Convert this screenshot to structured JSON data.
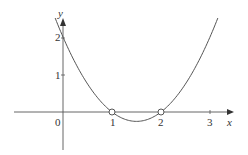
{
  "chart_data": {
    "type": "line",
    "title": "",
    "xlabel": "x",
    "ylabel": "y",
    "function": "y = x^2 - 3x + 2",
    "x_ticks": [
      "1",
      "2",
      "3"
    ],
    "y_ticks": [
      "1",
      "2"
    ],
    "origin_label": "0",
    "xlim": [
      -1,
      3.5
    ],
    "ylim": [
      -1,
      2.6
    ],
    "open_circles": [
      {
        "x": 1,
        "y": 0
      },
      {
        "x": 2,
        "y": 0
      }
    ],
    "series": [
      {
        "name": "curve",
        "x": [
          -0.16,
          0,
          0.5,
          1,
          1.5,
          2,
          2.5,
          3,
          3.16
        ],
        "y": [
          2.51,
          2,
          0.75,
          0,
          -0.25,
          0,
          0.75,
          2,
          2.51
        ]
      }
    ],
    "grid": false,
    "legend": null
  },
  "labels": {
    "x_axis": "x",
    "y_axis": "y",
    "origin": "0",
    "xt1": "1",
    "xt2": "2",
    "xt3": "3",
    "yt1": "1",
    "yt2": "2"
  }
}
